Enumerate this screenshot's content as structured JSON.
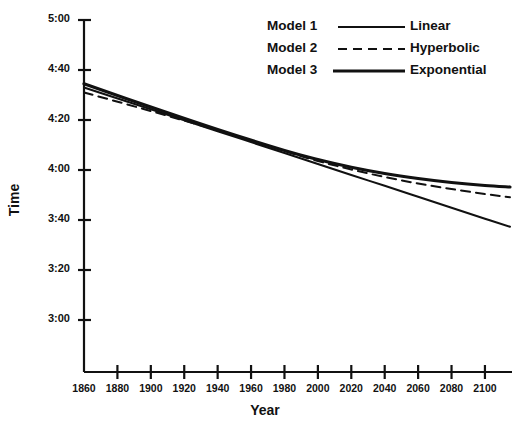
{
  "chart_data": {
    "type": "line",
    "title": "",
    "xlabel": "Year",
    "ylabel": "Time",
    "xlim": [
      1860,
      2115
    ],
    "ylim": [
      180,
      300
    ],
    "grid": false,
    "y_unit": "minutes:seconds",
    "xticks": [
      1860,
      1880,
      1900,
      1920,
      1940,
      1960,
      1980,
      2000,
      2020,
      2040,
      2060,
      2080,
      2100
    ],
    "xticklabels": [
      "1860",
      "1880",
      "1900",
      "1920",
      "1940",
      "1960",
      "1980",
      "2000",
      "2020",
      "2040",
      "2060",
      "2080",
      "2100"
    ],
    "yticks": [
      300,
      280,
      260,
      240,
      220,
      200,
      180
    ],
    "yticklabels": [
      "5:00",
      "4:40",
      "4:20",
      "4:00",
      "3:40",
      "3:20",
      "3:00"
    ],
    "legend_position": "top-right",
    "series": [
      {
        "name": "Model 1",
        "label": "Linear",
        "style": "solid-thin",
        "x": [
          1860,
          1900,
          1940,
          1980,
          2000,
          2020,
          2040,
          2060,
          2080,
          2100,
          2115
        ],
        "y": [
          273.0,
          264.3,
          255.5,
          246.8,
          242.4,
          238.0,
          233.7,
          229.3,
          224.9,
          220.5,
          217.3
        ]
      },
      {
        "name": "Model 2",
        "label": "Hyperbolic",
        "style": "dashed",
        "x": [
          1860,
          1900,
          1940,
          1980,
          2000,
          2020,
          2040,
          2060,
          2080,
          2100,
          2115
        ],
        "y": [
          271.0,
          263.6,
          255.8,
          247.6,
          243.6,
          240.2,
          237.2,
          234.6,
          232.4,
          230.4,
          229.1
        ]
      },
      {
        "name": "Model 3",
        "label": "Exponential",
        "style": "solid-thick",
        "x": [
          1860,
          1900,
          1940,
          1980,
          2000,
          2020,
          2040,
          2060,
          2080,
          2100,
          2115
        ],
        "y": [
          274.5,
          265.2,
          256.2,
          247.8,
          244.2,
          241.1,
          238.6,
          236.6,
          235.0,
          233.8,
          233.2
        ]
      }
    ]
  },
  "axes": {
    "y_title": "Time",
    "x_title": "Year"
  },
  "legend": {
    "rows": [
      {
        "model": "Model 1",
        "kind": "Linear",
        "sample": "solid-thin-line-icon"
      },
      {
        "model": "Model 2",
        "kind": "Hyperbolic",
        "sample": "dashed-line-icon"
      },
      {
        "model": "Model 3",
        "kind": "Exponential",
        "sample": "solid-thick-line-icon"
      }
    ]
  },
  "colors": {
    "ink": "#111111",
    "background": "#ffffff"
  }
}
